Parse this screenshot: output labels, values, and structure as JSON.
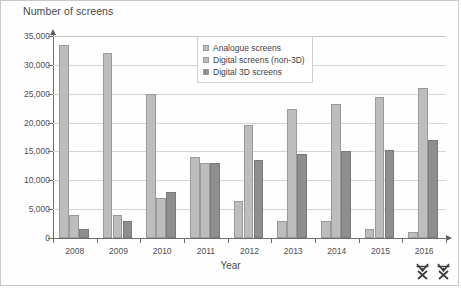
{
  "chart_data": {
    "type": "bar",
    "title": "",
    "ylabel": "Number of screens",
    "xlabel": "Year",
    "categories": [
      "2008",
      "2009",
      "2010",
      "2011",
      "2012",
      "2013",
      "2014",
      "2015",
      "2016"
    ],
    "series": [
      {
        "name": "Analogue screens",
        "color": "#bdbdbd",
        "values": [
          33500,
          32000,
          25000,
          14000,
          6500,
          3000,
          3000,
          1500,
          1000
        ]
      },
      {
        "name": "Digital screens (non-3D)",
        "color": "#bdbdbd",
        "values": [
          4000,
          4000,
          7000,
          13000,
          19500,
          22300,
          23200,
          24500,
          26000
        ]
      },
      {
        "name": "Digital 3D screens",
        "color": "#8e8e8e",
        "values": [
          1500,
          3000,
          8000,
          13000,
          13500,
          14500,
          15000,
          15200,
          17000
        ]
      }
    ],
    "yticks": [
      0,
      5000,
      10000,
      15000,
      20000,
      25000,
      30000,
      35000
    ],
    "ytick_labels": [
      "0",
      "5,000",
      "10,000",
      "15,000",
      "20,000",
      "25,000",
      "30,000",
      "35,000"
    ],
    "ylim": [
      0,
      35000
    ],
    "grid": true,
    "legend_position": "top-center"
  },
  "legend": {
    "items": [
      {
        "label": "Analogue screens"
      },
      {
        "label": "Digital screens (non-3D)"
      },
      {
        "label": "Digital 3D screens"
      }
    ]
  },
  "corner_marks": [
    {
      "name": "scissors-mark-1"
    },
    {
      "name": "scissors-mark-2"
    }
  ]
}
